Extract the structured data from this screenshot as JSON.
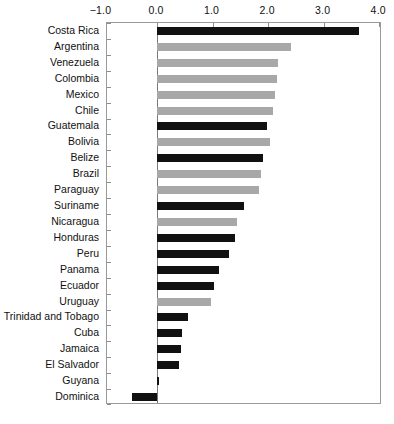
{
  "chart_data": {
    "type": "bar",
    "orientation": "horizontal",
    "title": "",
    "subtitle": "",
    "xlabel": "",
    "ylabel": "",
    "xlim": [
      -0.9,
      4.05
    ],
    "ylim": null,
    "grid": false,
    "legend": null,
    "axis_position": "top",
    "xticks": [
      -1.0,
      0.0,
      1.0,
      2.0,
      3.0,
      4.0
    ],
    "xtick_labels": [
      "−1.0",
      "0.0",
      "1.0",
      "2.0",
      "3.0",
      "4.0"
    ],
    "zero_reference_line": 0.0,
    "series_colors": {
      "dark": "#111111",
      "light": "#a8a8a8"
    },
    "categories": [
      "Costa Rica",
      "Argentina",
      "Venezuela",
      "Colombia",
      "Mexico",
      "Chile",
      "Guatemala",
      "Bolivia",
      "Belize",
      "Brazil",
      "Paraguay",
      "Suriname",
      "Nicaragua",
      "Honduras",
      "Peru",
      "Panama",
      "Ecuador",
      "Uruguay",
      "Trinidad and Tobago",
      "Cuba",
      "Jamaica",
      "El Salvador",
      "Guyana",
      "Dominica"
    ],
    "values": [
      3.64,
      2.41,
      2.17,
      2.16,
      2.13,
      2.09,
      1.98,
      2.04,
      1.91,
      1.87,
      1.84,
      1.56,
      1.44,
      1.4,
      1.3,
      1.12,
      1.03,
      0.97,
      0.56,
      0.45,
      0.43,
      0.4,
      0.03,
      -0.45
    ],
    "shades": [
      "dark",
      "light",
      "light",
      "light",
      "light",
      "light",
      "dark",
      "light",
      "dark",
      "light",
      "light",
      "dark",
      "light",
      "dark",
      "dark",
      "dark",
      "dark",
      "light",
      "dark",
      "dark",
      "dark",
      "dark",
      "dark",
      "dark"
    ]
  }
}
